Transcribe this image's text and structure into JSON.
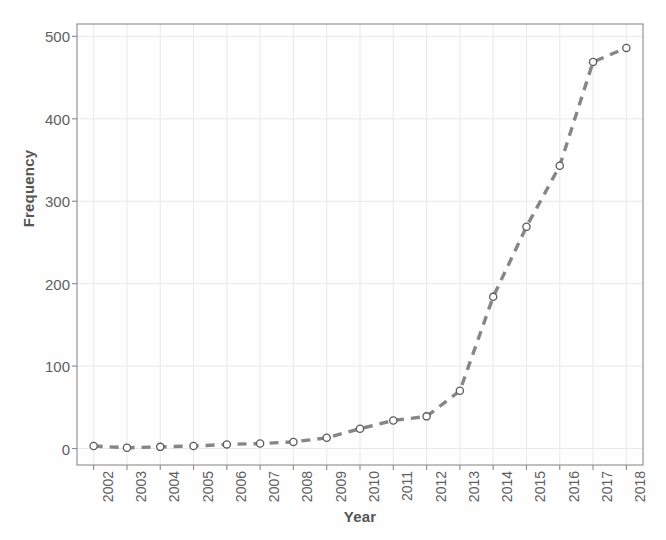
{
  "chart_data": {
    "type": "line",
    "title": "",
    "xlabel": "Year",
    "ylabel": "Frequency",
    "categories": [
      "2002",
      "2003",
      "2004",
      "2005",
      "2006",
      "2007",
      "2008",
      "2009",
      "2010",
      "2011",
      "2012",
      "2013",
      "2014",
      "2015",
      "2016",
      "2017",
      "2018"
    ],
    "x": [
      2002,
      2003,
      2004,
      2005,
      2006,
      2007,
      2008,
      2009,
      2010,
      2011,
      2012,
      2013,
      2014,
      2015,
      2016,
      2017,
      2018
    ],
    "values": [
      3,
      1,
      2,
      3,
      5,
      6,
      8,
      13,
      24,
      34,
      39,
      70,
      184,
      269,
      343,
      469,
      486
    ],
    "series": [
      {
        "name": "Frequency",
        "values": [
          3,
          1,
          2,
          3,
          5,
          6,
          8,
          13,
          24,
          34,
          39,
          70,
          184,
          269,
          343,
          469,
          486
        ]
      }
    ],
    "xlim": [
      2001.5,
      2018.5
    ],
    "ylim": [
      -20,
      515
    ],
    "yticks": [
      0,
      100,
      200,
      300,
      400,
      500
    ],
    "ytick_labels": [
      "0",
      "100",
      "200",
      "300",
      "400",
      "500"
    ],
    "xtick_labels": [
      "2002",
      "2003",
      "2004",
      "2005",
      "2006",
      "2007",
      "2008",
      "2009",
      "2010",
      "2011",
      "2012",
      "2013",
      "2014",
      "2015",
      "2016",
      "2017",
      "2018"
    ],
    "grid": true,
    "legend": false,
    "legend_position": "none",
    "line_style": "dashed",
    "marker": "open-circle",
    "line_color": "#6b6b6b",
    "marker_edge_color": "#5c5c5c",
    "marker_face_color": "#ffffff",
    "grid_color": "#e8e8ee",
    "axis_color": "#8a8a8a",
    "background_color": "#fefefe"
  },
  "axis": {
    "x_title": "Year",
    "y_title": "Frequency"
  }
}
